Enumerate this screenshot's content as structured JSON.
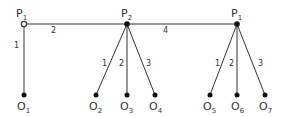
{
  "diagram": {
    "type": "tree",
    "colors": {
      "stroke": "#333333",
      "text": "#333333",
      "background": "#ffffff"
    },
    "top_nodes": [
      {
        "id": "P1-left",
        "base": "P",
        "sub": "1",
        "marker": "hollow",
        "x": 24,
        "y": 24
      },
      {
        "id": "P2",
        "base": "P",
        "sub": "2",
        "marker": "filled",
        "x": 127,
        "y": 24
      },
      {
        "id": "P1-right",
        "base": "P",
        "sub": "1",
        "marker": "filled",
        "x": 237,
        "y": 24
      }
    ],
    "horizontal_edges": [
      {
        "from": "P1-left",
        "to": "P2",
        "label": "2"
      },
      {
        "from": "P2",
        "to": "P1-right",
        "label": "4"
      }
    ],
    "leaves": [
      {
        "id": "O1",
        "base": "O",
        "sub": "1",
        "x": 24,
        "y": 95
      },
      {
        "id": "O2",
        "base": "O",
        "sub": "2",
        "x": 96,
        "y": 95
      },
      {
        "id": "O3",
        "base": "O",
        "sub": "3",
        "x": 127,
        "y": 95
      },
      {
        "id": "O4",
        "base": "O",
        "sub": "4",
        "x": 155,
        "y": 95
      },
      {
        "id": "O5",
        "base": "O",
        "sub": "5",
        "x": 210,
        "y": 95
      },
      {
        "id": "O6",
        "base": "O",
        "sub": "6",
        "x": 237,
        "y": 95
      },
      {
        "id": "O7",
        "base": "O",
        "sub": "7",
        "x": 265,
        "y": 95
      }
    ],
    "branch_edges": [
      {
        "from": "P1-left",
        "to": "O1",
        "label": "1"
      },
      {
        "from": "P2",
        "to": "O2",
        "label": "1"
      },
      {
        "from": "P2",
        "to": "O3",
        "label": "2"
      },
      {
        "from": "P2",
        "to": "O4",
        "label": "3"
      },
      {
        "from": "P1-right",
        "to": "O5",
        "label": "1"
      },
      {
        "from": "P1-right",
        "to": "O6",
        "label": "2"
      },
      {
        "from": "P1-right",
        "to": "O7",
        "label": "3"
      }
    ]
  }
}
